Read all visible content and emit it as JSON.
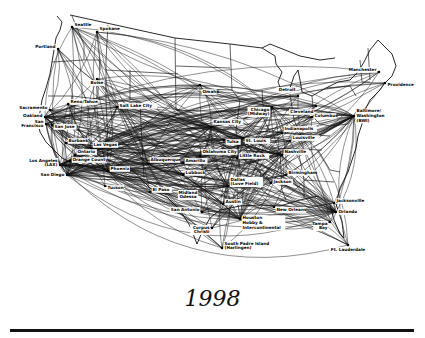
{
  "title": "1998",
  "map": {
    "subject": "airline route network",
    "cities": [
      {
        "id": "SEA",
        "name": "Seattle",
        "lines": [
          "Seattle"
        ]
      },
      {
        "id": "GEG",
        "name": "Spokane",
        "lines": [
          "Spokane"
        ]
      },
      {
        "id": "PDX",
        "name": "Portland",
        "lines": [
          "Portland"
        ]
      },
      {
        "id": "BOI",
        "name": "Boise",
        "lines": [
          "Boise"
        ]
      },
      {
        "id": "RNO",
        "name": "Reno/Tahoe",
        "lines": [
          "Reno/Tahoe"
        ]
      },
      {
        "id": "SMF",
        "name": "Sacramento",
        "lines": [
          "Sacramento"
        ]
      },
      {
        "id": "OAK",
        "name": "Oakland",
        "lines": [
          "Oakland"
        ]
      },
      {
        "id": "SFO",
        "name": "San Francisco",
        "lines": [
          "San",
          "Francisco"
        ]
      },
      {
        "id": "SJC",
        "name": "San Jose",
        "lines": [
          "San Jose"
        ]
      },
      {
        "id": "SLC",
        "name": "Salt Lake City",
        "lines": [
          "Salt Lake City"
        ]
      },
      {
        "id": "LAS",
        "name": "Las Vegas",
        "lines": [
          "Las Vegas"
        ]
      },
      {
        "id": "BUR",
        "name": "Burbank",
        "lines": [
          "Burbank"
        ]
      },
      {
        "id": "ONT",
        "name": "Ontario",
        "lines": [
          "Ontario"
        ]
      },
      {
        "id": "SNA",
        "name": "Orange County",
        "lines": [
          "Orange County"
        ]
      },
      {
        "id": "LAX",
        "name": "Los Angeles (LAX)",
        "lines": [
          "Los Angeles",
          "(LAX)"
        ]
      },
      {
        "id": "SAN",
        "name": "San Diego",
        "lines": [
          "San Diego"
        ]
      },
      {
        "id": "PHX",
        "name": "Phoenix",
        "lines": [
          "Phoenix"
        ]
      },
      {
        "id": "TUS",
        "name": "Tucson",
        "lines": [
          "Tucson"
        ]
      },
      {
        "id": "ABQ",
        "name": "Albuquerque",
        "lines": [
          "Albuquerque"
        ]
      },
      {
        "id": "ELP",
        "name": "El Paso",
        "lines": [
          "El Paso"
        ]
      },
      {
        "id": "AMA",
        "name": "Amarillo",
        "lines": [
          "Amarillo"
        ]
      },
      {
        "id": "LBB",
        "name": "Lubbock",
        "lines": [
          "Lubbock"
        ]
      },
      {
        "id": "MAF",
        "name": "Midland Odessa",
        "lines": [
          "Midland",
          "Odessa"
        ]
      },
      {
        "id": "OMA",
        "name": "Omaha",
        "lines": [
          "Omaha"
        ]
      },
      {
        "id": "MCI",
        "name": "Kansas City",
        "lines": [
          "Kansas City"
        ]
      },
      {
        "id": "STL",
        "name": "St. Louis",
        "lines": [
          "St. Louis"
        ]
      },
      {
        "id": "OKC",
        "name": "Oklahoma City",
        "lines": [
          "Oklahoma City"
        ]
      },
      {
        "id": "TUL",
        "name": "Tulsa",
        "lines": [
          "Tulsa"
        ]
      },
      {
        "id": "LIT",
        "name": "Little Rock",
        "lines": [
          "Little Rock"
        ]
      },
      {
        "id": "DAL",
        "name": "Dallas (Love Field)",
        "lines": [
          "Dallas",
          "(Love Field)"
        ]
      },
      {
        "id": "AUS",
        "name": "Austin",
        "lines": [
          "Austin"
        ]
      },
      {
        "id": "SAT",
        "name": "San Antonio",
        "lines": [
          "San Antonio"
        ]
      },
      {
        "id": "CRP",
        "name": "Corpus Christi",
        "lines": [
          "Corpus",
          "Christi"
        ]
      },
      {
        "id": "HOU",
        "name": "Houston Hobby & Intercontinental",
        "lines": [
          "Houston",
          "Hobby &",
          "Intercontinental"
        ]
      },
      {
        "id": "HRL",
        "name": "South Padre Island (Harlingen)",
        "lines": [
          "South Padre Island",
          "(Harlingen)"
        ]
      },
      {
        "id": "MSY",
        "name": "New Orleans",
        "lines": [
          "New Orleans"
        ]
      },
      {
        "id": "JAN",
        "name": "Jackson",
        "lines": [
          "Jackson"
        ]
      },
      {
        "id": "BHM",
        "name": "Birmingham",
        "lines": [
          "Birmingham"
        ]
      },
      {
        "id": "BNA",
        "name": "Nashville",
        "lines": [
          "Nashville"
        ]
      },
      {
        "id": "SDF",
        "name": "Louisville",
        "lines": [
          "Louisville"
        ]
      },
      {
        "id": "IND",
        "name": "Indianapolis",
        "lines": [
          "Indianapolis"
        ]
      },
      {
        "id": "MDW",
        "name": "Chicago (Midway)",
        "lines": [
          "Chicago",
          "(Midway)"
        ]
      },
      {
        "id": "DTW",
        "name": "Detroit",
        "lines": [
          "Detroit"
        ]
      },
      {
        "id": "CLE",
        "name": "Cleveland",
        "lines": [
          "Cleveland"
        ]
      },
      {
        "id": "CMH",
        "name": "Columbus",
        "lines": [
          "Columbus"
        ]
      },
      {
        "id": "BWI",
        "name": "Baltimore/Washington (BWI)",
        "lines": [
          "Baltimore/",
          "Washington",
          "(BWI)"
        ]
      },
      {
        "id": "PVD",
        "name": "Providence",
        "lines": [
          "Providence"
        ]
      },
      {
        "id": "MHT",
        "name": "Manchester",
        "lines": [
          "Manchester"
        ]
      },
      {
        "id": "JAX",
        "name": "Jacksonville",
        "lines": [
          "Jacksonville"
        ]
      },
      {
        "id": "MCO",
        "name": "Orlando",
        "lines": [
          "Orlando"
        ]
      },
      {
        "id": "TPA",
        "name": "Tampa Bay",
        "lines": [
          "Tampa",
          "Bay"
        ]
      },
      {
        "id": "FLL",
        "name": "Ft. Lauderdale",
        "lines": [
          "Ft. Lauderdale"
        ]
      }
    ],
    "hubs": [
      "OAK",
      "LAS",
      "PHX",
      "DAL",
      "HOU",
      "MDW",
      "BWI",
      "MCO",
      "STL",
      "SLC",
      "SAN",
      "LAX",
      "ABQ",
      "MCI",
      "BNA"
    ]
  }
}
